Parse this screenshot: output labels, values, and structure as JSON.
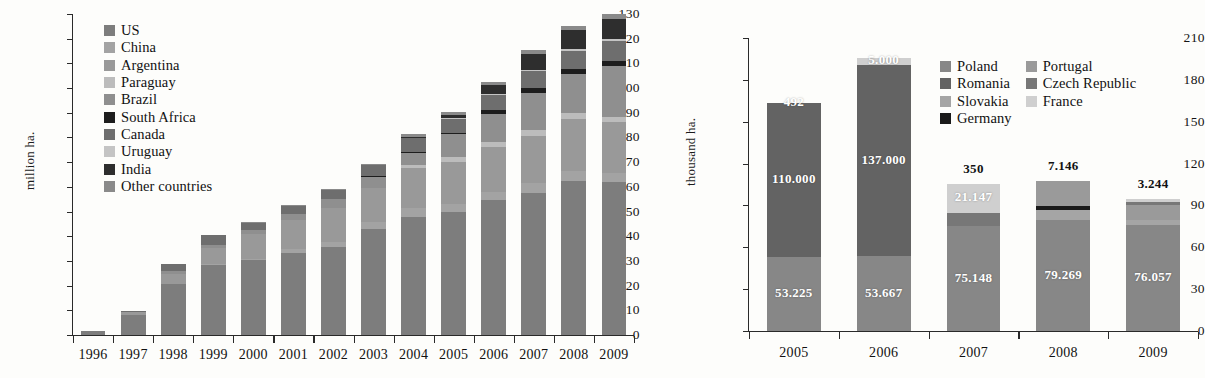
{
  "chart_data": [
    {
      "id": "left",
      "type": "bar",
      "stacked": true,
      "title": "",
      "xlabel": "",
      "ylabel": "million ha.",
      "ylim": [
        0,
        130
      ],
      "yticks": [
        0,
        10,
        20,
        30,
        40,
        50,
        60,
        70,
        80,
        90,
        100,
        110,
        120,
        130
      ],
      "ytick_labels": [
        "0",
        "10",
        "20",
        "30",
        "40",
        "50",
        "60",
        "70",
        "80",
        "90",
        "100",
        "110",
        "120",
        "130"
      ],
      "grid": false,
      "legend_position": "inside-top-left",
      "categories": [
        "1996",
        "1997",
        "1998",
        "1999",
        "2000",
        "2001",
        "2002",
        "2003",
        "2004",
        "2005",
        "2006",
        "2007",
        "2008",
        "2009"
      ],
      "series": [
        {
          "name": "US",
          "color": "#7d7d7d",
          "values": [
            1.5,
            8.1,
            20.5,
            28.4,
            30.3,
            33.3,
            35.7,
            42.8,
            47.6,
            49.8,
            54.6,
            57.7,
            62.5,
            64.0
          ]
        },
        {
          "name": "China",
          "color": "#a3a3a3",
          "values": [
            0.0,
            0.0,
            0.0,
            0.3,
            0.5,
            1.5,
            2.1,
            2.8,
            3.7,
            3.3,
            3.5,
            3.8,
            3.8,
            3.7
          ]
        },
        {
          "name": "Argentina",
          "color": "#999999",
          "values": [
            0.1,
            1.4,
            4.3,
            6.7,
            10.0,
            11.8,
            13.5,
            13.9,
            16.2,
            17.1,
            18.0,
            19.1,
            21.0,
            21.3
          ]
        },
        {
          "name": "Paraguay",
          "color": "#bcbcbc",
          "values": [
            0.0,
            0.0,
            0.0,
            0.0,
            0.0,
            0.0,
            0.0,
            0.0,
            1.2,
            1.8,
            2.0,
            2.6,
            2.7,
            2.2
          ]
        },
        {
          "name": "Brazil",
          "color": "#8f8f8f",
          "values": [
            0.0,
            0.0,
            1.1,
            1.2,
            1.6,
            2.4,
            3.6,
            4.5,
            5.0,
            9.4,
            11.5,
            15.0,
            15.8,
            21.4
          ]
        },
        {
          "name": "South Africa",
          "color": "#1d1d1d",
          "values": [
            0.0,
            0.0,
            0.0,
            0.0,
            0.1,
            0.2,
            0.2,
            0.4,
            0.5,
            0.5,
            1.4,
            1.8,
            1.8,
            2.1
          ]
        },
        {
          "name": "Canada",
          "color": "#6e6e6e",
          "values": [
            0.1,
            0.2,
            2.8,
            4.0,
            3.0,
            3.2,
            3.5,
            4.4,
            5.4,
            5.8,
            6.1,
            7.0,
            7.6,
            8.2
          ]
        },
        {
          "name": "Uruguay",
          "color": "#c4c4c4",
          "values": [
            0.0,
            0.0,
            0.0,
            0.0,
            0.0,
            0.0,
            0.0,
            0.0,
            0.3,
            0.3,
            0.4,
            0.5,
            0.7,
            0.8
          ]
        },
        {
          "name": "India",
          "color": "#2e2e2e",
          "values": [
            0.0,
            0.0,
            0.0,
            0.0,
            0.0,
            0.0,
            0.0,
            0.0,
            0.5,
            1.3,
            3.8,
            6.2,
            7.6,
            8.4
          ]
        },
        {
          "name": "Other countries",
          "color": "#8a8a8a",
          "values": [
            0.0,
            0.0,
            0.0,
            0.0,
            0.2,
            0.4,
            0.5,
            0.6,
            1.0,
            1.1,
            1.3,
            1.6,
            1.8,
            2.1
          ]
        }
      ]
    },
    {
      "id": "right",
      "type": "bar",
      "stacked": true,
      "title": "",
      "xlabel": "",
      "ylabel": "thousand ha.",
      "ylim": [
        0,
        210
      ],
      "yticks": [
        0,
        30,
        60,
        90,
        120,
        150,
        180,
        210
      ],
      "ytick_labels": [
        "0",
        "30",
        "60",
        "90",
        "120",
        "150",
        "180",
        "210"
      ],
      "grid": false,
      "legend_position": "inside-top-right",
      "categories": [
        "2005",
        "2006",
        "2007",
        "2008",
        "2009"
      ],
      "series": [
        {
          "name": "Poland",
          "color": "#878787",
          "values": [
            53.225,
            53.667,
            75.148,
            79.269,
            76.057
          ]
        },
        {
          "name": "Romania",
          "color": "#636363",
          "values": [
            110.0,
            137.0,
            0,
            0,
            0
          ]
        },
        {
          "name": "Slovakia",
          "color": "#a5a5a5",
          "values": [
            0,
            0,
            0,
            7.146,
            3.244
          ]
        },
        {
          "name": "Germany",
          "color": "#1a1a1a",
          "values": [
            0,
            0,
            0.35,
            3.171,
            0
          ]
        },
        {
          "name": "Portugal",
          "color": "#9a9a9a",
          "values": [
            0,
            0,
            0,
            18.0,
            11.0
          ]
        },
        {
          "name": "Czech Republic",
          "color": "#777777",
          "values": [
            0.492,
            0,
            9.0,
            0,
            2.5
          ]
        },
        {
          "name": "France",
          "color": "#cfcfcf",
          "values": [
            0,
            5.0,
            21.147,
            0,
            2.0
          ]
        }
      ],
      "value_labels": [
        {
          "category": "2005",
          "text": "110.000",
          "inside": true
        },
        {
          "category": "2005",
          "text": "492",
          "inside": true
        },
        {
          "category": "2005",
          "text": "53.225",
          "inside": true
        },
        {
          "category": "2006",
          "text": "137.000",
          "inside": true
        },
        {
          "category": "2006",
          "text": "5.000",
          "inside": true
        },
        {
          "category": "2006",
          "text": "53.667",
          "inside": true
        },
        {
          "category": "2007",
          "text": "350",
          "inside": false
        },
        {
          "category": "2007",
          "text": "21.147",
          "inside": true
        },
        {
          "category": "2007",
          "text": "75.148",
          "inside": true
        },
        {
          "category": "2008",
          "text": "7.146",
          "inside": false
        },
        {
          "category": "2008",
          "text": "79.269",
          "inside": true
        },
        {
          "category": "2009",
          "text": "3.244",
          "inside": false
        },
        {
          "category": "2009",
          "text": "76.057",
          "inside": true
        }
      ]
    }
  ],
  "left_chart": {
    "ylabel": "million ha.",
    "yticks": [
      "130",
      "120",
      "110",
      "100",
      "90",
      "80",
      "70",
      "60",
      "50",
      "40",
      "30",
      "20",
      "10",
      "0"
    ],
    "xticks": [
      "1996",
      "1997",
      "1998",
      "1999",
      "2000",
      "2001",
      "2002",
      "2003",
      "2004",
      "2005",
      "2006",
      "2007",
      "2008",
      "2009"
    ],
    "legend": [
      {
        "label": "US",
        "color": "#7d7d7d"
      },
      {
        "label": "China",
        "color": "#a3a3a3"
      },
      {
        "label": "Argentina",
        "color": "#999999"
      },
      {
        "label": "Paraguay",
        "color": "#bcbcbc"
      },
      {
        "label": "Brazil",
        "color": "#8f8f8f"
      },
      {
        "label": "South Africa",
        "color": "#1d1d1d"
      },
      {
        "label": "Canada",
        "color": "#6e6e6e"
      },
      {
        "label": "Uruguay",
        "color": "#c4c4c4"
      },
      {
        "label": "India",
        "color": "#2e2e2e"
      },
      {
        "label": "Other countries",
        "color": "#8a8a8a"
      }
    ]
  },
  "right_chart": {
    "ylabel": "thousand ha.",
    "yticks": [
      "210",
      "180",
      "150",
      "120",
      "90",
      "60",
      "30",
      "0"
    ],
    "xticks": [
      "2005",
      "2006",
      "2007",
      "2008",
      "2009"
    ],
    "legend_col1": [
      {
        "label": "Poland",
        "color": "#878787"
      },
      {
        "label": "Romania",
        "color": "#636363"
      },
      {
        "label": "Slovakia",
        "color": "#a5a5a5"
      },
      {
        "label": "Germany",
        "color": "#1a1a1a"
      }
    ],
    "legend_col2": [
      {
        "label": "Portugal",
        "color": "#9a9a9a"
      },
      {
        "label": "Czech Republic",
        "color": "#777777"
      },
      {
        "label": "France",
        "color": "#cfcfcf"
      }
    ]
  }
}
